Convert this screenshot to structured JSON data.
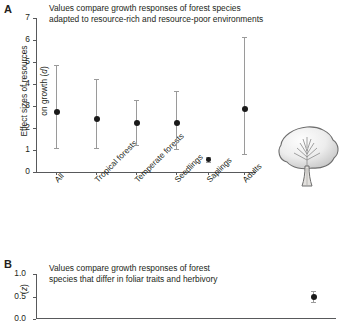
{
  "figure": {
    "panel_a_letter": "A",
    "panel_b_letter": "B"
  },
  "panel_a": {
    "caption": "Values compare growth responses of forest species\nadapted to resource-rich and resource-poor environments",
    "ylabel_line1": "Effect sizes of resources",
    "ylabel_line2": "on growth (",
    "ylabel_symbol": "d",
    "ylabel_close": ")"
  },
  "panel_b": {
    "caption": "Values compare growth responses of forest\nspecies that differ in foliar traits and herbivory",
    "ylabel_open": "(",
    "ylabel_symbol": "z",
    "ylabel_close": ")"
  },
  "chart_data": [
    {
      "type": "scatter",
      "panel": "A",
      "title": "Values compare growth responses of forest species adapted to resource-rich and resource-poor environments",
      "xlabel": "",
      "ylabel": "Effect sizes of resources on growth (d)",
      "ylim": [
        0,
        7
      ],
      "yticks": [
        0,
        1,
        2,
        3,
        4,
        5,
        6,
        7
      ],
      "ytick_labels": [
        "0",
        "1",
        "2",
        "3",
        "4",
        "5",
        "6",
        "7"
      ],
      "grid": false,
      "legend": "none",
      "categories": [
        "All",
        "Tropical forests",
        "Temperate forests",
        "Seedlings",
        "Saplings",
        "Adults"
      ],
      "values": [
        2.75,
        2.4,
        2.25,
        2.25,
        0.55,
        2.85
      ],
      "error_low": [
        1.07,
        1.08,
        1.25,
        1.03,
        0.45,
        0.8
      ],
      "error_high": [
        4.85,
        4.25,
        3.28,
        3.68,
        0.68,
        6.15
      ],
      "point_color": "#1a1a1a",
      "errorbar_color": "#9a9a9a"
    },
    {
      "type": "scatter",
      "panel": "B",
      "title": "Values compare growth responses of forest species that differ in foliar traits and herbivory",
      "xlabel": "",
      "ylabel": "(z)",
      "ylim": [
        0,
        1.0
      ],
      "yticks": [
        0.0,
        0.5,
        1.0
      ],
      "ytick_labels": [
        "0.0",
        "0.5",
        "1.0"
      ],
      "grid": false,
      "legend": "none",
      "categories": [
        ""
      ],
      "values": [
        0.5
      ],
      "error_low": [
        0.38
      ],
      "error_high": [
        0.62
      ],
      "point_color": "#1a1a1a",
      "errorbar_color": "#9a9a9a",
      "note": "panel cropped at image bottom edge"
    }
  ],
  "illustration": {
    "name": "tree"
  }
}
